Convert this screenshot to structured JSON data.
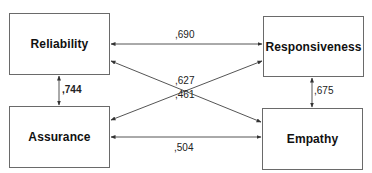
{
  "diagram": {
    "type": "correlation-path-diagram",
    "nodes": [
      {
        "id": "reliability",
        "label": "Reliability"
      },
      {
        "id": "responsiveness",
        "label": "Responsiveness"
      },
      {
        "id": "assurance",
        "label": "Assurance"
      },
      {
        "id": "empathy",
        "label": "Empathy"
      }
    ],
    "edges": [
      {
        "from": "reliability",
        "to": "responsiveness",
        "label": ",690",
        "direction": "bidirectional"
      },
      {
        "from": "reliability",
        "to": "empathy",
        "label": ",461",
        "direction": "bidirectional"
      },
      {
        "from": "assurance",
        "to": "responsiveness",
        "label": ",627",
        "direction": "bidirectional"
      },
      {
        "from": "assurance",
        "to": "empathy",
        "label": ",504",
        "direction": "bidirectional"
      },
      {
        "from": "reliability",
        "to": "assurance",
        "label": ",744",
        "direction": "bidirectional"
      },
      {
        "from": "responsiveness",
        "to": "empathy",
        "label": ",675",
        "direction": "bidirectional"
      }
    ]
  },
  "colors": {
    "line": "#555555",
    "box_border": "#6a6a6a",
    "text": "#111111",
    "background": "#ffffff"
  }
}
